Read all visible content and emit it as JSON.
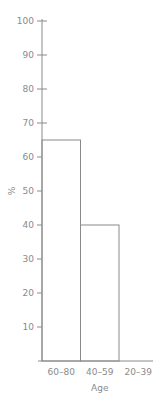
{
  "chart_data": {
    "type": "bar",
    "title": "",
    "xlabel": "Age",
    "ylabel": "%",
    "categories": [
      "60–80",
      "40–59",
      "20–39"
    ],
    "values": [
      65,
      40,
      0
    ],
    "ylim": [
      0,
      100
    ],
    "yticks": [
      10,
      20,
      30,
      40,
      50,
      60,
      70,
      80,
      90,
      100
    ],
    "grid": false,
    "legend": null,
    "bar_style": "outline",
    "colors": {
      "line": "#8a8a8a",
      "text": "#8a8a8a",
      "bar_fill": "#ffffff"
    }
  }
}
